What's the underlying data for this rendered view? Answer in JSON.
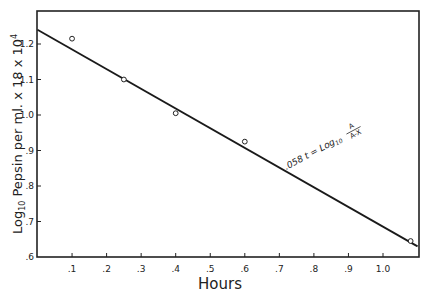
{
  "chart_data": {
    "type": "scatter",
    "title": "",
    "xlabel": "Hours",
    "ylabel": "Log10 Pepsin per ml. x 18 x 10^4",
    "ylabel_parts": {
      "log": "Log",
      "sub": "10",
      "rest": " Pepsin per ml. x 18 x 10",
      "sup": "4"
    },
    "xlim": [
      0,
      1.1
    ],
    "ylim": [
      0.6,
      1.3
    ],
    "x_ticks": [
      0.1,
      0.2,
      0.3,
      0.4,
      0.5,
      0.6,
      0.7,
      0.8,
      0.9,
      1.0
    ],
    "x_tick_labels": [
      ".1",
      ".2",
      ".3",
      ".4",
      ".5",
      ".6",
      ".7",
      ".8",
      ".9",
      "1.0"
    ],
    "y_ticks": [
      0.6,
      0.7,
      0.8,
      0.9,
      1.0,
      1.1,
      1.2
    ],
    "y_tick_labels": [
      ".6",
      ".7",
      ".8",
      ".9",
      "1.0",
      "1.1",
      "1.2"
    ],
    "grid": false,
    "series": [
      {
        "name": "Observed",
        "marker": "open-circle",
        "x": [
          0.1,
          0.25,
          0.4,
          0.6,
          1.08
        ],
        "y": [
          1.215,
          1.1,
          1.005,
          0.925,
          0.645
        ]
      },
      {
        "name": "Fitted line",
        "marker": "line",
        "x": [
          0.0,
          1.1
        ],
        "y": [
          1.24,
          0.63
        ]
      }
    ],
    "annotations": [
      {
        "text_parts": {
          "lhs": ".058 t = Log",
          "sub": "10",
          "num": "A",
          "den": "A-X"
        },
        "x": 0.72,
        "y": 0.845,
        "rotation_deg": -28
      }
    ]
  }
}
